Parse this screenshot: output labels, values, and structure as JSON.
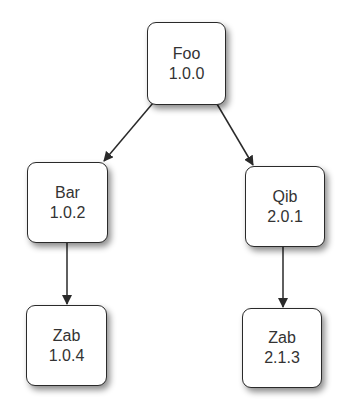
{
  "diagram": {
    "type": "dependency-tree",
    "nodes": [
      {
        "id": "foo",
        "name": "Foo",
        "version": "1.0.0"
      },
      {
        "id": "bar",
        "name": "Bar",
        "version": "1.0.2"
      },
      {
        "id": "qib",
        "name": "Qib",
        "version": "2.0.1"
      },
      {
        "id": "zab104",
        "name": "Zab",
        "version": "1.0.4"
      },
      {
        "id": "zab213",
        "name": "Zab",
        "version": "2.1.3"
      }
    ],
    "edges": [
      {
        "from": "foo",
        "to": "bar"
      },
      {
        "from": "foo",
        "to": "qib"
      },
      {
        "from": "bar",
        "to": "zab104"
      },
      {
        "from": "qib",
        "to": "zab213"
      }
    ],
    "colors": {
      "node_border": "#2a2a2a",
      "node_fill": "#ffffff",
      "text": "#333333",
      "edge": "#2a2a2a"
    }
  }
}
